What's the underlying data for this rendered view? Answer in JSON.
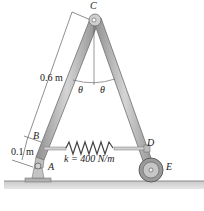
{
  "figure": {
    "points": {
      "A": "A",
      "B": "B",
      "C": "C",
      "D": "D",
      "E": "E"
    },
    "angles": {
      "left": "θ",
      "right": "θ"
    },
    "dimensions": {
      "length_bc": "0.6 m",
      "length_ab": "0.1 m"
    },
    "spring": {
      "label": "k = 400 N/m"
    },
    "colors": {
      "member_fill": "#b8b8b8",
      "member_edge": "#6e6e6e",
      "ground": "#a9a9a9",
      "text": "#1a1a1a"
    }
  }
}
